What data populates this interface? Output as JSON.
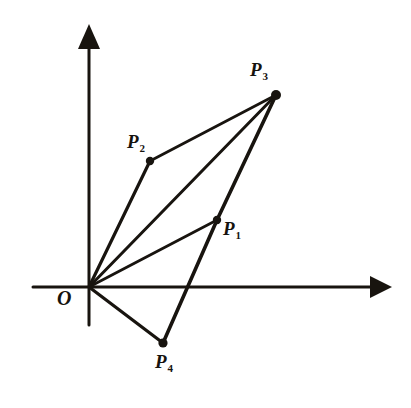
{
  "figure": {
    "kind": "vector-diagram",
    "background_color": "#ffffff",
    "stroke_color": "#18140f",
    "width": 411,
    "height": 408
  },
  "axes": {
    "x_axis": {
      "name": "x-axis",
      "from": [
        33,
        287
      ],
      "to": [
        392,
        287
      ],
      "arrow": "right",
      "stroke_width": 3
    },
    "y_axis": {
      "name": "y-axis",
      "from": [
        89,
        325
      ],
      "to": [
        89,
        24
      ],
      "arrow": "up",
      "stroke_width": 3
    },
    "origin": {
      "label": "O",
      "point": [
        89,
        287
      ],
      "label_pos": [
        57,
        288
      ]
    }
  },
  "points": [
    {
      "id": "P1",
      "label": "P",
      "subscript": "1",
      "point": [
        217,
        220
      ],
      "label_pos": [
        223,
        219
      ],
      "dot_radius": 4.2
    },
    {
      "id": "P2",
      "label": "P",
      "subscript": "2",
      "point": [
        150,
        161
      ],
      "label_pos": [
        127,
        132
      ],
      "dot_radius": 4.2
    },
    {
      "id": "P3",
      "label": "P",
      "subscript": "3",
      "point": [
        276,
        95
      ],
      "label_pos": [
        250,
        60
      ],
      "dot_radius": 5.0
    },
    {
      "id": "P4",
      "label": "P",
      "subscript": "4",
      "point": [
        163,
        343
      ],
      "label_pos": [
        155,
        352
      ],
      "dot_radius": 4.6
    }
  ],
  "edges": [
    {
      "name": "O-to-P2",
      "from": [
        89,
        287
      ],
      "to": [
        150,
        161
      ],
      "stroke_width": 3.2
    },
    {
      "name": "O-to-P3",
      "from": [
        89,
        287
      ],
      "to": [
        276,
        95
      ],
      "stroke_width": 3.0
    },
    {
      "name": "O-to-P1",
      "from": [
        89,
        287
      ],
      "to": [
        217,
        220
      ],
      "stroke_width": 2.8
    },
    {
      "name": "O-to-P4",
      "from": [
        89,
        287
      ],
      "to": [
        163,
        343
      ],
      "stroke_width": 3.2
    },
    {
      "name": "P2-to-P3",
      "from": [
        150,
        161
      ],
      "to": [
        276,
        95
      ],
      "stroke_width": 2.8
    },
    {
      "name": "P4-to-P1",
      "from": [
        163,
        343
      ],
      "to": [
        217,
        220
      ],
      "stroke_width": 3.6
    },
    {
      "name": "P1-to-P3",
      "from": [
        217,
        220
      ],
      "to": [
        276,
        95
      ],
      "stroke_width": 3.6
    }
  ],
  "chart_data": {
    "type": "scatter",
    "title": "",
    "xlabel": "",
    "ylabel": "",
    "axis_origin_px": [
      89,
      287
    ],
    "series": [
      {
        "name": "vector endpoints",
        "labels": [
          "P1",
          "P2",
          "P3",
          "P4"
        ],
        "x_px": [
          217,
          150,
          276,
          163
        ],
        "y_px": [
          220,
          161,
          95,
          343
        ],
        "x": [
          128,
          61,
          187,
          74
        ],
        "y": [
          67,
          126,
          192,
          -56
        ]
      }
    ],
    "grid": false,
    "legend": "none"
  }
}
